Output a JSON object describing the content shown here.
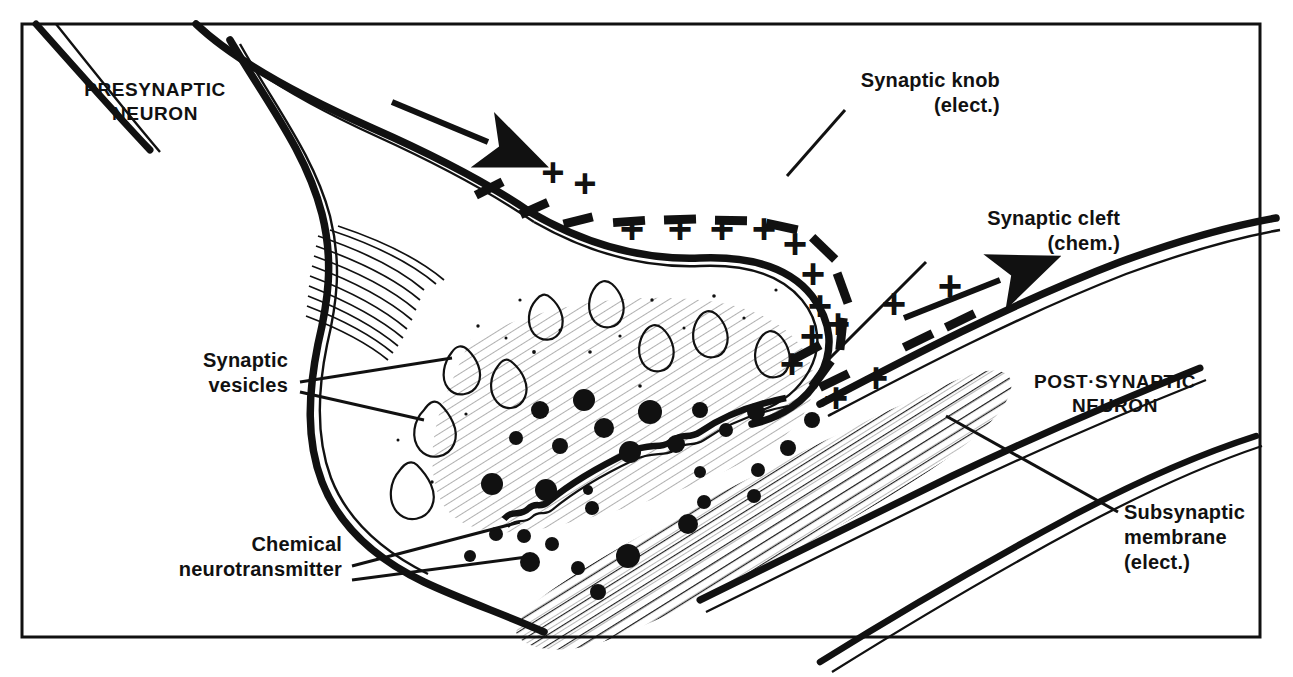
{
  "figure": {
    "kind": "line-drawing",
    "background_color": "#ffffff",
    "ink_color": "#111111",
    "frame": {
      "x": 22,
      "y": 24,
      "width": 1238,
      "height": 613,
      "stroke": 3
    }
  },
  "labels": {
    "presynaptic": {
      "line1": "PRESYNAPTIC",
      "line2": "NEURON",
      "style": "caps"
    },
    "postsynaptic": {
      "line1": "POST·SYNAPTIC",
      "line2": "NEURON",
      "style": "caps"
    },
    "synaptic_knob": {
      "line1": "Synaptic knob",
      "line2": "(elect.)",
      "style": "mixed"
    },
    "synaptic_cleft": {
      "line1": "Synaptic cleft",
      "line2": "(chem.)",
      "style": "mixed"
    },
    "synaptic_vesicles": {
      "line1": "Synaptic",
      "line2": "vesicles",
      "style": "mixed"
    },
    "chemical_neurotransmitter": {
      "line1": "Chemical",
      "line2": "neurotransmitter",
      "style": "mixed"
    },
    "subsynaptic_membrane": {
      "line1": "Subsynaptic",
      "line2": "membrane",
      "line3": "(elect.)",
      "style": "mixed"
    }
  },
  "symbols": {
    "plus": "+",
    "minus": "–",
    "plus_count_presynaptic_upper": 3,
    "plus_count_presynaptic_inner": 9,
    "plus_count_postsynaptic": 5,
    "minus_count_presynaptic": 11,
    "minus_count_postsynaptic": 4,
    "arrow_count": 2,
    "vesicle_count": 9,
    "neurotransmitter_dot_count": 30
  },
  "annotations": {
    "arrow_presynaptic_direction": "right-down",
    "arrow_postsynaptic_direction": "right-up",
    "hatching": "diagonal-line-shading",
    "membrane_rendering": "double-line"
  }
}
